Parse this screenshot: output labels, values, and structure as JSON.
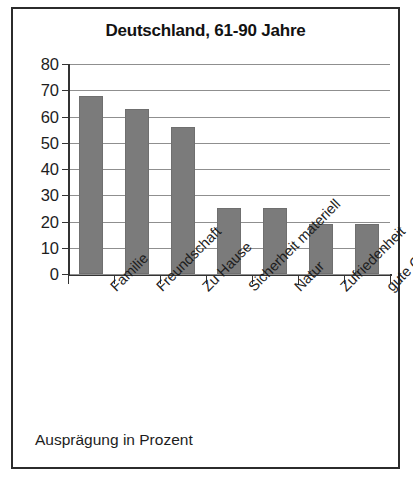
{
  "figure": {
    "footer_note": "Ausprägung in Prozent",
    "border_color": "#2b2b2b",
    "background": "#ffffff"
  },
  "chart_data": {
    "type": "bar",
    "title": "Deutschland, 61-90 Jahre",
    "xlabel": "",
    "ylabel": "",
    "ylim": [
      0,
      80
    ],
    "yticks": [
      0,
      10,
      20,
      30,
      40,
      50,
      60,
      70,
      80
    ],
    "ytick_labels": [
      "0",
      "10",
      "20",
      "30",
      "40",
      "50",
      "60",
      "70",
      "80"
    ],
    "grid": true,
    "legend": null,
    "bar_color": "#7b7b7b",
    "categories": [
      "Familie",
      "Freundschaft",
      "Zu Hause",
      "Sicherheit materiell",
      "Natur",
      "Zufriedenheit",
      "gute Gespräche"
    ],
    "values": [
      68,
      63,
      56,
      25,
      25,
      19,
      19
    ],
    "annotation": "Ausprägung in Prozent"
  }
}
